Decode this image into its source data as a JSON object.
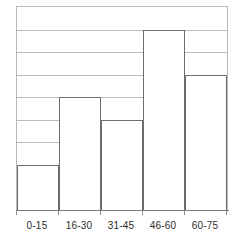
{
  "chart_data": {
    "type": "bar",
    "title": "",
    "subtitle": "",
    "xlabel": "",
    "ylabel": "",
    "categories": [
      "0-15",
      "16-30",
      "31-45",
      "46-60",
      "60-75"
    ],
    "values": [
      2,
      5,
      4,
      8,
      6
    ],
    "ylim": [
      0,
      9
    ],
    "y_tick_count": 9,
    "y_tick_labels": [],
    "x_tick_labels": [
      "0-15",
      "16-30",
      "31-45",
      "46-60",
      "60-75"
    ],
    "grid": true,
    "grid_axis": "y",
    "legend": false,
    "legend_position": "none",
    "bar_style": "histogram-contiguous",
    "annotations": []
  },
  "style": {
    "background_color": "#ffffff",
    "plot_border_color": "#b9b9b9",
    "gridline_color": "#bdbdbd",
    "bar_fill_color": "#ffffff",
    "bar_outline_color": "#6e6e6e",
    "axis_line_color": "#7a7a7a",
    "tick_mark_color": "#8c8c8c",
    "label_text_color": "#2e2e2e"
  }
}
